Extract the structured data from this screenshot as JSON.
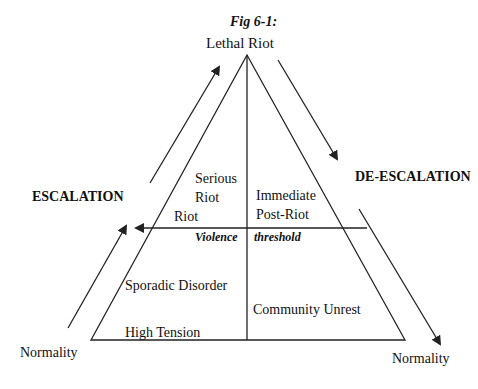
{
  "figure": {
    "caption": "Fig 6-1:",
    "apex_label": "Lethal Riot",
    "escalation_label": "ESCALATION",
    "deescalation_label": "DE-ESCALATION",
    "normality_left": "Normality",
    "normality_right": "Normality",
    "threshold": {
      "left": "Violence",
      "right": "threshold"
    },
    "regions": {
      "serious_riot_1": "Serious",
      "serious_riot_2": "Riot",
      "riot": "Riot",
      "immediate_post_riot_1": "Immediate",
      "immediate_post_riot_2": "Post-Riot",
      "sporadic_disorder": "Sporadic Disorder",
      "community_unrest": "Community Unrest",
      "high_tension": "High Tension"
    },
    "colors": {
      "line": "#222222",
      "background": "#ffffff"
    }
  }
}
